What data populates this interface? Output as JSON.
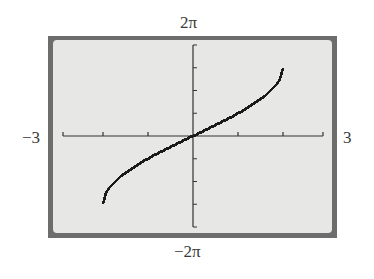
{
  "chart_data": {
    "type": "line",
    "title": "",
    "function": "y = 3 arcsin(x/2)",
    "xlabel": "",
    "ylabel": "",
    "xlim": [
      -3,
      3
    ],
    "ylim": [
      "-2π",
      "2π"
    ],
    "ylim_numeric": [
      -6.2832,
      6.2832
    ],
    "x_tick_step": 1,
    "y_tick_step": "π/2",
    "grid": false,
    "labels": {
      "xmin": "−3",
      "xmax": "3",
      "ymin": "−2π",
      "ymax": "2π"
    },
    "x": [
      -2,
      -1.9,
      -1.75,
      -1.5,
      -1.25,
      -1,
      -0.75,
      -0.5,
      -0.25,
      0,
      0.25,
      0.5,
      0.75,
      1,
      1.25,
      1.5,
      1.75,
      1.9,
      2
    ],
    "y": [
      -4.712,
      -3.752,
      -3.184,
      -2.544,
      -2.028,
      -1.571,
      -1.152,
      -0.758,
      -0.376,
      0,
      0.376,
      0.758,
      1.152,
      1.571,
      2.028,
      2.544,
      3.184,
      3.752,
      4.712
    ],
    "colors": {
      "frame": "#6d6d6d",
      "screen": "#e7e7e5",
      "curve": "#1a1a1a",
      "axes": "#333333"
    }
  }
}
